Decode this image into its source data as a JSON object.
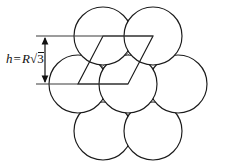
{
  "figure": {
    "label": {
      "name": "height-dimension-label",
      "variable": "h",
      "equals": "=",
      "radius_symbol": "R",
      "radical_sign": "√",
      "radicand": "3",
      "full_text": "h = R√3"
    },
    "colors": {
      "background": "#ffffff",
      "stroke": "#1a1a1a",
      "guide": "#3a3a3a",
      "shading": "#9a9a9a",
      "text": "#111111"
    },
    "geometry": {
      "circle_radius": 29,
      "row_spacing": 50.2,
      "circles": [
        {
          "name": "circle-top-left",
          "cx": 103,
          "cy": 36
        },
        {
          "name": "circle-top-right",
          "cx": 153,
          "cy": 36
        },
        {
          "name": "circle-mid-left",
          "cx": 78,
          "cy": 84
        },
        {
          "name": "circle-mid-center",
          "cx": 128,
          "cy": 84
        },
        {
          "name": "circle-mid-right",
          "cx": 178,
          "cy": 84
        },
        {
          "name": "circle-bottom-left",
          "cx": 103,
          "cy": 131
        },
        {
          "name": "circle-bottom-right",
          "cx": 153,
          "cy": 131
        }
      ],
      "unit_cell_vertices": [
        {
          "x": 103,
          "y": 36
        },
        {
          "x": 153,
          "y": 36
        },
        {
          "x": 128,
          "y": 84
        },
        {
          "x": 78,
          "y": 84
        }
      ],
      "guide_lines": [
        {
          "name": "upper-guide-line",
          "x1": 36,
          "y1": 36,
          "x2": 153,
          "y2": 36
        },
        {
          "name": "lower-guide-line",
          "x1": 36,
          "y1": 84,
          "x2": 128,
          "y2": 84
        }
      ],
      "dimension_line": {
        "name": "height-dimension-line",
        "x": 45,
        "y1": 36,
        "y2": 84
      }
    }
  }
}
